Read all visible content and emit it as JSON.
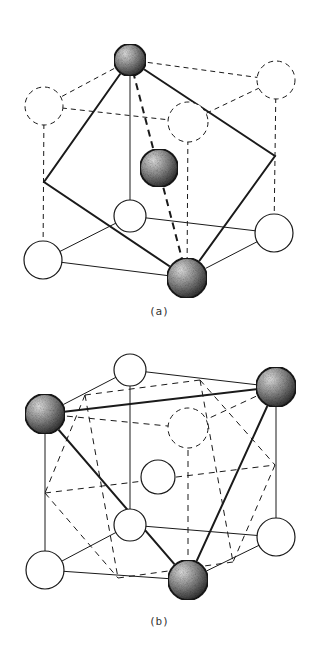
{
  "figure": {
    "panels": [
      {
        "id": "a",
        "label": "(a)"
      },
      {
        "id": "b",
        "label": "(b)"
      }
    ],
    "colors": {
      "line": "#1a1a1a",
      "shaded_sphere": "#555555",
      "background": "#ffffff"
    }
  }
}
